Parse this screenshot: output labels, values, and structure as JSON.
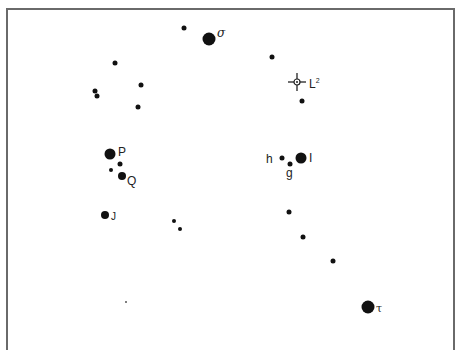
{
  "figure": {
    "title": "",
    "frame_color": "#6a6a6a",
    "star_color": "#111111"
  },
  "stars": [
    {
      "id": "s1",
      "x": 184,
      "y": 28,
      "size": "small",
      "label": ""
    },
    {
      "id": "sigma",
      "x": 209,
      "y": 39,
      "size": "huge",
      "label": "σ"
    },
    {
      "id": "s3",
      "x": 115,
      "y": 63,
      "size": "small",
      "label": ""
    },
    {
      "id": "s4",
      "x": 272,
      "y": 57,
      "size": "small",
      "label": ""
    },
    {
      "id": "s5",
      "x": 141,
      "y": 85,
      "size": "small",
      "label": ""
    },
    {
      "id": "s6",
      "x": 95,
      "y": 91,
      "size": "small",
      "label": ""
    },
    {
      "id": "s7",
      "x": 97,
      "y": 96,
      "size": "small",
      "label": ""
    },
    {
      "id": "s8",
      "x": 138,
      "y": 107,
      "size": "small",
      "label": ""
    },
    {
      "id": "s9",
      "x": 302,
      "y": 101,
      "size": "small",
      "label": ""
    },
    {
      "id": "P",
      "x": 110,
      "y": 154,
      "size": "big",
      "label": "P"
    },
    {
      "id": "s11",
      "x": 120,
      "y": 164,
      "size": "small",
      "label": ""
    },
    {
      "id": "s12",
      "x": 111,
      "y": 170,
      "size": "small",
      "label": ""
    },
    {
      "id": "Q",
      "x": 122,
      "y": 176,
      "size": "med",
      "label": "Q"
    },
    {
      "id": "h",
      "x": 282,
      "y": 158,
      "size": "small",
      "label": "h"
    },
    {
      "id": "g",
      "x": 290,
      "y": 164,
      "size": "small",
      "label": "g"
    },
    {
      "id": "I",
      "x": 301,
      "y": 158,
      "size": "big",
      "label": "I"
    },
    {
      "id": "J",
      "x": 105,
      "y": 215,
      "size": "med",
      "label": "J"
    },
    {
      "id": "s18",
      "x": 174,
      "y": 221,
      "size": "small",
      "label": ""
    },
    {
      "id": "s19",
      "x": 180,
      "y": 229,
      "size": "small",
      "label": ""
    },
    {
      "id": "s20",
      "x": 289,
      "y": 212,
      "size": "small",
      "label": ""
    },
    {
      "id": "s21",
      "x": 303,
      "y": 237,
      "size": "small",
      "label": ""
    },
    {
      "id": "s22",
      "x": 333,
      "y": 261,
      "size": "small",
      "label": ""
    },
    {
      "id": "tau",
      "x": 368,
      "y": 307,
      "size": "huge",
      "label": "τ"
    },
    {
      "id": "s24",
      "x": 126,
      "y": 302,
      "size": "tiny",
      "label": ""
    }
  ],
  "markers": {
    "L2": {
      "x": 297,
      "y": 82,
      "label": "L",
      "sup": "2"
    }
  },
  "labels": {
    "sigma": "σ",
    "tau": "τ",
    "P": "P",
    "Q": "Q",
    "J": "J",
    "h": "h",
    "g": "g",
    "I": "I",
    "L": "L",
    "L_sup": "2"
  }
}
